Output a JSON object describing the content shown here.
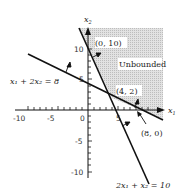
{
  "diagram": {
    "type": "linear-programming-feasible-region",
    "axes": {
      "x_label": "x1",
      "y_label": "x2",
      "x_ticks": [
        "-10",
        "-5",
        "0",
        "5"
      ],
      "y_ticks": [
        "10",
        "5",
        "-5",
        "-10"
      ]
    },
    "constraints": [
      {
        "label": "x₁ + 2x₂ = 8"
      },
      {
        "label": "2x₁ + x₂ = 10"
      }
    ],
    "points": [
      {
        "label": "(0, 10)"
      },
      {
        "label": "(4, 2)"
      },
      {
        "label": "(8, 0)"
      }
    ],
    "region_label": "Unbounded",
    "colors": {
      "shade": "#d6d6d6",
      "line": "#111111"
    }
  }
}
